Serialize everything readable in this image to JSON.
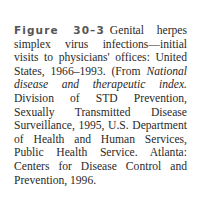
{
  "figure": {
    "label": "Figure 30–3",
    "caption_part1": "Genital herpes simplex virus infections—initial visits to physicians' offices: United States, 1966–1993. (From ",
    "source_title": "National disease and therapeutic index.",
    "caption_part2": " Division of STD Prevention, Sexually Transmitted Disease Surveillance, 1995, U.S. Department of Health and Human Services, Public Health Service. Atlanta: Centers for Disease Control and Prevention, 1996."
  },
  "colors": {
    "text": "#2a2a2a",
    "label": "#555555",
    "background": "#ffffff"
  }
}
